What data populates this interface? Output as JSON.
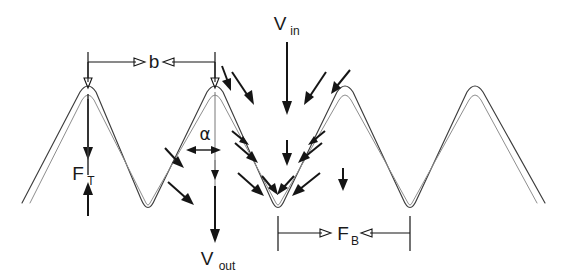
{
  "figure": {
    "background_color": "#ffffff",
    "line_color": "#3d3d3d",
    "inner_line_color": "#8e8e8e",
    "arrow_color": "#151515",
    "width": 562,
    "height": 277
  },
  "labels": {
    "v_in": {
      "base": "V",
      "sub": "in"
    },
    "v_out": {
      "base": "V",
      "sub": "out"
    },
    "f_t": {
      "base": "F",
      "sub": "T"
    },
    "f_b": {
      "base": "F",
      "sub": "B"
    },
    "pitch": {
      "base": "b"
    },
    "angle": {
      "base": "α"
    }
  },
  "geometry": {
    "peaks_x": [
      88,
      215,
      345,
      475
    ],
    "valleys_x": [
      148,
      278,
      410
    ],
    "peak_y": 88,
    "valley_y": 213,
    "left_edge_x": 22,
    "right_edge_x": 545,
    "edge_y": 203
  },
  "annotations": {
    "pitch_dimension": {
      "from_x": 88,
      "to_x": 215,
      "y": 62,
      "label": "b"
    },
    "ft_dimension": {
      "x": 88,
      "top_y": 100,
      "bottom_y": 215,
      "label": "F_T"
    },
    "fb_dimension": {
      "from_x": 278,
      "to_x": 410,
      "y": 233,
      "label": "F_B"
    },
    "vin_arrow": {
      "x": 287,
      "from_y": 38,
      "to_y": 112,
      "label": "V_in"
    },
    "vout_arrow": {
      "x": 215,
      "from_y": 130,
      "to_y": 240,
      "label": "V_out"
    },
    "angle_marker": {
      "x": 215,
      "y": 148,
      "label": "α"
    }
  },
  "flow_arrows": {
    "count": 12,
    "description": "inward-converging flow vectors around the central valley"
  }
}
